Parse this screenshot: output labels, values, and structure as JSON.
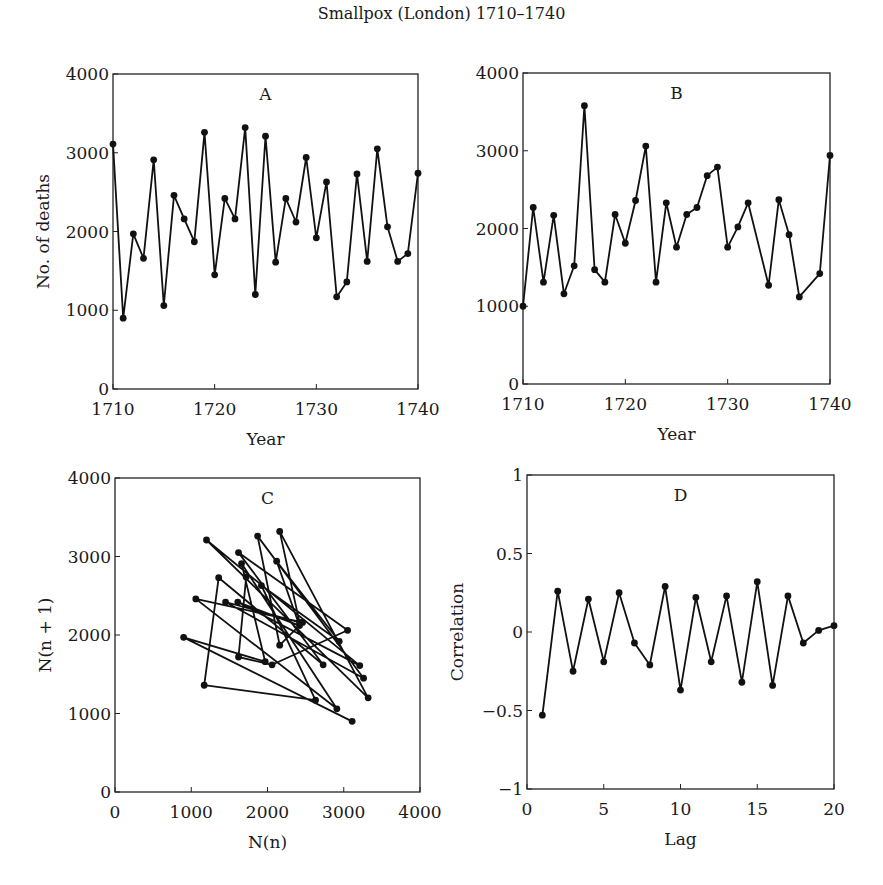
{
  "figure_title": "Smallpox (London) 1710–1740",
  "chart_data": [
    {
      "id": "A",
      "type": "line",
      "title": "A",
      "xlabel": "Year",
      "ylabel": "No. of deaths",
      "xlim": [
        1710,
        1740
      ],
      "ylim": [
        0,
        4000
      ],
      "xticks": [
        1710,
        1720,
        1730,
        1740
      ],
      "yticks": [
        0,
        1000,
        2000,
        3000,
        4000
      ],
      "grid": false,
      "x": [
        1710,
        1711,
        1712,
        1713,
        1714,
        1715,
        1716,
        1717,
        1718,
        1719,
        1720,
        1721,
        1722,
        1723,
        1724,
        1725,
        1726,
        1727,
        1728,
        1729,
        1730,
        1731,
        1732,
        1733,
        1734,
        1735,
        1736,
        1737,
        1738,
        1739,
        1740
      ],
      "values": [
        3110,
        900,
        1970,
        1660,
        2910,
        1060,
        2460,
        2160,
        1870,
        3260,
        1450,
        2420,
        2160,
        3320,
        1200,
        3210,
        1610,
        2420,
        2120,
        2940,
        1920,
        2630,
        1170,
        1360,
        2730,
        1620,
        3050,
        2060,
        1620,
        1720,
        2740
      ]
    },
    {
      "id": "B",
      "type": "line",
      "title": "B",
      "xlabel": "Year",
      "ylabel": "",
      "xlim": [
        1710,
        1740
      ],
      "ylim": [
        0,
        4000
      ],
      "xticks": [
        1710,
        1720,
        1730,
        1740
      ],
      "yticks": [
        0,
        1000,
        2000,
        3000,
        4000
      ],
      "grid": false,
      "x": [
        1710,
        1711,
        1712,
        1713,
        1714,
        1715,
        1716,
        1717,
        1718,
        1719,
        1720,
        1721,
        1722,
        1723,
        1724,
        1725,
        1726,
        1727,
        1728,
        1729,
        1730,
        1731,
        1732,
        1734,
        1735,
        1736,
        1737,
        1739,
        1740
      ],
      "values": [
        1000,
        2270,
        1310,
        2170,
        1160,
        1520,
        3580,
        1470,
        1310,
        2180,
        1810,
        2360,
        3060,
        1310,
        2330,
        1760,
        2180,
        2270,
        2680,
        2790,
        1760,
        2020,
        2330,
        1270,
        2370,
        1920,
        1120,
        1420,
        2940
      ]
    },
    {
      "id": "C",
      "type": "scatter",
      "title": "C",
      "xlabel": "N(n)",
      "ylabel": "N(n + 1)",
      "xlim": [
        0,
        4000
      ],
      "ylim": [
        0,
        4000
      ],
      "xticks": [
        0,
        1000,
        2000,
        3000,
        4000
      ],
      "yticks": [
        0,
        1000,
        2000,
        3000,
        4000
      ],
      "grid": false,
      "connected": true,
      "note": "Successive pairs (N(n), N(n+1)) from series A",
      "x": [
        3110,
        900,
        1970,
        1660,
        2910,
        1060,
        2460,
        2160,
        1870,
        3260,
        1450,
        2420,
        2160,
        3320,
        1200,
        3210,
        1610,
        2420,
        2120,
        2940,
        1920,
        2630,
        1170,
        1360,
        2730,
        1620,
        3050,
        2060,
        1620,
        1720
      ],
      "values": [
        900,
        1970,
        1660,
        2910,
        1060,
        2460,
        2160,
        1870,
        3260,
        1450,
        2420,
        2160,
        3320,
        1200,
        3210,
        1610,
        2420,
        2120,
        2940,
        1920,
        2630,
        1170,
        1360,
        2730,
        1620,
        3050,
        2060,
        1620,
        1720,
        2740
      ]
    },
    {
      "id": "D",
      "type": "line",
      "title": "D",
      "xlabel": "Lag",
      "ylabel": "Correlation",
      "xlim": [
        0,
        20
      ],
      "ylim": [
        -1,
        1
      ],
      "xticks": [
        0,
        5,
        10,
        15,
        20
      ],
      "yticks": [
        -1,
        -0.5,
        0,
        0.5,
        1
      ],
      "ytick_labels": [
        "−1",
        "−0.5",
        "0",
        "0.5",
        "1"
      ],
      "grid": false,
      "x": [
        1,
        2,
        3,
        4,
        5,
        6,
        7,
        8,
        9,
        10,
        11,
        12,
        13,
        14,
        15,
        16,
        17,
        18,
        19,
        20
      ],
      "values": [
        -0.53,
        0.26,
        -0.25,
        0.21,
        -0.19,
        0.25,
        -0.07,
        -0.21,
        0.29,
        -0.37,
        0.22,
        -0.19,
        0.23,
        -0.32,
        0.32,
        -0.34,
        0.23,
        -0.07,
        0.01,
        0.04
      ]
    }
  ]
}
